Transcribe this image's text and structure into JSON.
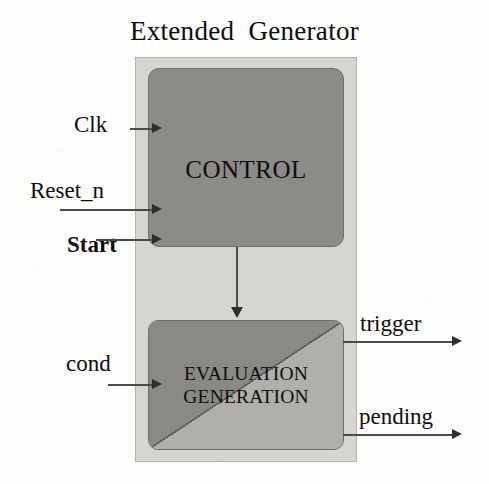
{
  "diagram": {
    "title": "Extended  Generator",
    "blocks": {
      "control": {
        "label": "CONTROL"
      },
      "evaluation": {
        "line1": "EVALUATION",
        "line2": "GENERATION"
      }
    },
    "inputs": [
      {
        "name": "clk",
        "label": "Clk"
      },
      {
        "name": "reset_n",
        "label": "Reset_n"
      },
      {
        "name": "start",
        "label": "Start"
      },
      {
        "name": "cond",
        "label": "cond"
      }
    ],
    "outputs": [
      {
        "name": "trigger",
        "label": "trigger"
      },
      {
        "name": "pending",
        "label": "pending"
      }
    ],
    "colors": {
      "page_background": "#fdfdfc",
      "outer_container_fill": "#d6d5d2",
      "control_fill": "#8c8b88",
      "evaluation_dark_fill": "#8a8986",
      "evaluation_light_fill": "#b0afab",
      "line": "#4a4a48",
      "text": "#0d0d0d"
    }
  }
}
